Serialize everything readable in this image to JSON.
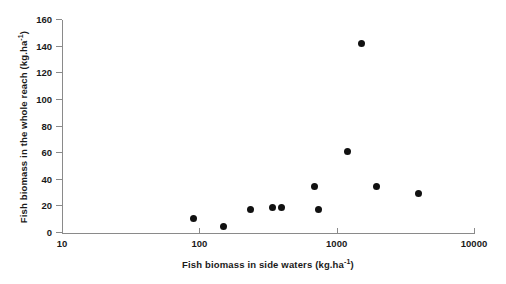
{
  "chart_data": {
    "type": "scatter",
    "title": "",
    "xlabel": "Fish biomass in side waters (kg.ha-1)",
    "ylabel": "Fish biomass in the whole reach (kg.ha-1)",
    "xlabel_parts": {
      "main": "Fish biomass in side waters (kg.ha",
      "sup": "-1",
      "tail": ")"
    },
    "ylabel_parts": {
      "main": "Fish biomass in the whole reach (kg.ha",
      "sup": "-1",
      "tail": ")"
    },
    "xscale": "log",
    "yscale": "linear",
    "xlim": [
      10,
      10000
    ],
    "ylim": [
      0,
      160
    ],
    "grid": false,
    "legend": null,
    "marker": {
      "shape": "circle",
      "color": "#111111",
      "size_px": 7
    },
    "axis_color": "#8a8a8a",
    "xticks": [
      {
        "value": 10,
        "label": "10"
      },
      {
        "value": 100,
        "label": "100"
      },
      {
        "value": 1000,
        "label": "1000"
      },
      {
        "value": 10000,
        "label": "10000"
      }
    ],
    "yticks": [
      {
        "value": 0,
        "label": "0"
      },
      {
        "value": 20,
        "label": "20"
      },
      {
        "value": 40,
        "label": "40"
      },
      {
        "value": 60,
        "label": "60"
      },
      {
        "value": 80,
        "label": "80"
      },
      {
        "value": 100,
        "label": "100"
      },
      {
        "value": 120,
        "label": "120"
      },
      {
        "value": 140,
        "label": "140"
      },
      {
        "value": 160,
        "label": "160"
      }
    ],
    "points": [
      {
        "x": 90,
        "y": 11
      },
      {
        "x": 150,
        "y": 5
      },
      {
        "x": 235,
        "y": 18
      },
      {
        "x": 340,
        "y": 19
      },
      {
        "x": 395,
        "y": 19
      },
      {
        "x": 690,
        "y": 35
      },
      {
        "x": 740,
        "y": 18
      },
      {
        "x": 1200,
        "y": 61
      },
      {
        "x": 1520,
        "y": 142
      },
      {
        "x": 1960,
        "y": 35
      },
      {
        "x": 3950,
        "y": 30
      }
    ]
  }
}
